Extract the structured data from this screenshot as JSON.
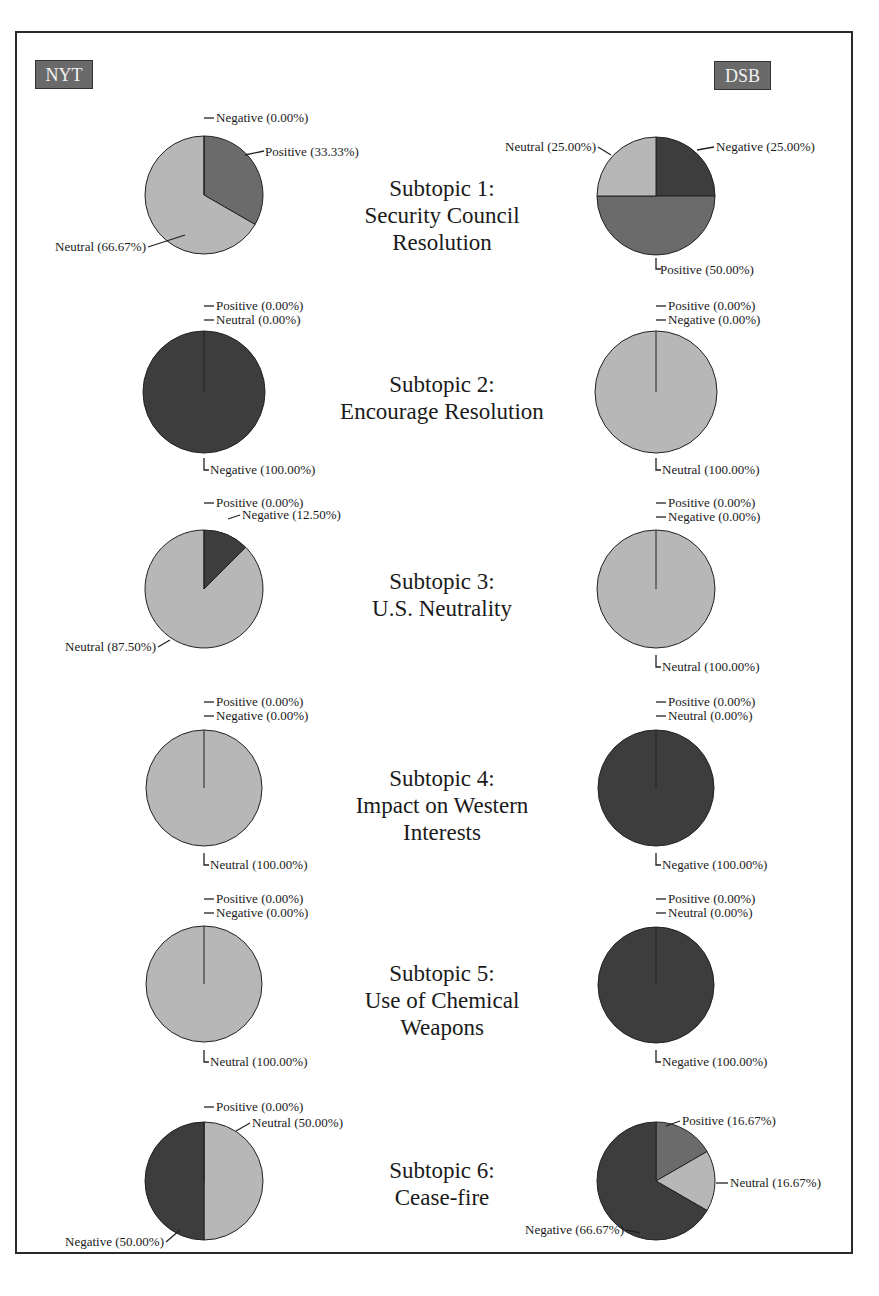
{
  "header": {
    "left_source": "NYT",
    "right_source": "DSB"
  },
  "colors": {
    "Positive": "#6b6b6b",
    "Neutral": "#b7b7b7",
    "Negative": "#3d3d3d",
    "badge": "#6a6a6a"
  },
  "subtopics": [
    {
      "title_line1": "Subtopic 1:",
      "title_line2": "Security Council",
      "title_line3": "Resolution"
    },
    {
      "title_line1": "Subtopic 2:",
      "title_line2": "Encourage Resolution",
      "title_line3": ""
    },
    {
      "title_line1": "Subtopic 3:",
      "title_line2": "U.S. Neutrality",
      "title_line3": ""
    },
    {
      "title_line1": "Subtopic 4:",
      "title_line2": "Impact on Western",
      "title_line3": "Interests"
    },
    {
      "title_line1": "Subtopic 5:",
      "title_line2": "Use of Chemical",
      "title_line3": "Weapons"
    },
    {
      "title_line1": "Subtopic 6:",
      "title_line2": "Cease-fire",
      "title_line3": ""
    }
  ],
  "chart_data": {
    "type": "pie",
    "sources": [
      "NYT",
      "DSB"
    ],
    "categories": [
      "Positive",
      "Neutral",
      "Negative"
    ],
    "charts": [
      {
        "subtopic": "Subtopic 1: Security Council Resolution",
        "source": "NYT",
        "slices": [
          {
            "label": "Negative",
            "value": 0.0
          },
          {
            "label": "Positive",
            "value": 33.33
          },
          {
            "label": "Neutral",
            "value": 66.67
          }
        ]
      },
      {
        "subtopic": "Subtopic 1: Security Council Resolution",
        "source": "DSB",
        "slices": [
          {
            "label": "Negative",
            "value": 25.0
          },
          {
            "label": "Positive",
            "value": 50.0
          },
          {
            "label": "Neutral",
            "value": 25.0
          }
        ]
      },
      {
        "subtopic": "Subtopic 2: Encourage Resolution",
        "source": "NYT",
        "slices": [
          {
            "label": "Positive",
            "value": 0.0
          },
          {
            "label": "Neutral",
            "value": 0.0
          },
          {
            "label": "Negative",
            "value": 100.0
          }
        ]
      },
      {
        "subtopic": "Subtopic 2: Encourage Resolution",
        "source": "DSB",
        "slices": [
          {
            "label": "Positive",
            "value": 0.0
          },
          {
            "label": "Negative",
            "value": 0.0
          },
          {
            "label": "Neutral",
            "value": 100.0
          }
        ]
      },
      {
        "subtopic": "Subtopic 3: U.S. Neutrality",
        "source": "NYT",
        "slices": [
          {
            "label": "Positive",
            "value": 0.0
          },
          {
            "label": "Negative",
            "value": 12.5
          },
          {
            "label": "Neutral",
            "value": 87.5
          }
        ]
      },
      {
        "subtopic": "Subtopic 3: U.S. Neutrality",
        "source": "DSB",
        "slices": [
          {
            "label": "Positive",
            "value": 0.0
          },
          {
            "label": "Negative",
            "value": 0.0
          },
          {
            "label": "Neutral",
            "value": 100.0
          }
        ]
      },
      {
        "subtopic": "Subtopic 4: Impact on Western Interests",
        "source": "NYT",
        "slices": [
          {
            "label": "Positive",
            "value": 0.0
          },
          {
            "label": "Negative",
            "value": 0.0
          },
          {
            "label": "Neutral",
            "value": 100.0
          }
        ]
      },
      {
        "subtopic": "Subtopic 4: Impact on Western Interests",
        "source": "DSB",
        "slices": [
          {
            "label": "Positive",
            "value": 0.0
          },
          {
            "label": "Neutral",
            "value": 0.0
          },
          {
            "label": "Negative",
            "value": 100.0
          }
        ]
      },
      {
        "subtopic": "Subtopic 5: Use of Chemical Weapons",
        "source": "NYT",
        "slices": [
          {
            "label": "Positive",
            "value": 0.0
          },
          {
            "label": "Negative",
            "value": 0.0
          },
          {
            "label": "Neutral",
            "value": 100.0
          }
        ]
      },
      {
        "subtopic": "Subtopic 5: Use of Chemical Weapons",
        "source": "DSB",
        "slices": [
          {
            "label": "Positive",
            "value": 0.0
          },
          {
            "label": "Neutral",
            "value": 0.0
          },
          {
            "label": "Negative",
            "value": 100.0
          }
        ]
      },
      {
        "subtopic": "Subtopic 6: Cease-fire",
        "source": "NYT",
        "slices": [
          {
            "label": "Positive",
            "value": 0.0
          },
          {
            "label": "Neutral",
            "value": 50.0
          },
          {
            "label": "Negative",
            "value": 50.0
          }
        ]
      },
      {
        "subtopic": "Subtopic 6: Cease-fire",
        "source": "DSB",
        "slices": [
          {
            "label": "Positive",
            "value": 16.67
          },
          {
            "label": "Neutral",
            "value": 16.67
          },
          {
            "label": "Negative",
            "value": 66.67
          }
        ]
      }
    ],
    "legend": "none (slices labeled directly)",
    "grid": false
  }
}
